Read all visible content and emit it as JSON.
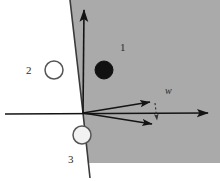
{
  "figure": {
    "type": "geometric-half-plane-diagram",
    "canvas": {
      "width": 220,
      "height": 181
    },
    "background_color": "#ffffff",
    "shaded_region_color": "#a8a8a8",
    "stroke_color": "#1a1a1a",
    "label_color": "#2b2b2b"
  },
  "labels": {
    "region_1": "1",
    "class_2": "2",
    "class_3": "3",
    "vector_w": "w"
  },
  "axes": {
    "horizontal": {
      "name": "horizontal-axis",
      "from": [
        5,
        113
      ],
      "to": [
        215,
        113
      ],
      "arrowhead": "right"
    },
    "vertical": {
      "name": "vertical-axis",
      "from": [
        83,
        113
      ],
      "to": [
        84,
        5
      ],
      "arrowhead": "up"
    },
    "origin": [
      83,
      113
    ]
  },
  "boundary_line": {
    "name": "decision-boundary",
    "points": [
      [
        70,
        0
      ],
      [
        83,
        113
      ],
      [
        90,
        178
      ]
    ]
  },
  "shaded_region": {
    "name": "positive-half-plane",
    "polygon": [
      [
        70,
        0
      ],
      [
        220,
        0
      ],
      [
        220,
        163
      ],
      [
        88,
        163
      ],
      [
        83,
        113
      ]
    ],
    "fill": "#a8a8a8"
  },
  "vectors": [
    {
      "name": "vector-upper",
      "from": [
        83,
        113
      ],
      "to": [
        156,
        101
      ],
      "arrowhead": true
    },
    {
      "name": "vector-lower",
      "from": [
        83,
        113
      ],
      "to": [
        158,
        126
      ],
      "arrowhead": true
    }
  ],
  "dashed_connector": {
    "name": "dashed-connector",
    "from": [
      155,
      101
    ],
    "to": [
      157,
      126
    ]
  },
  "markers": [
    {
      "name": "filled-point-class-1",
      "style": "filled",
      "center": [
        104,
        70
      ],
      "radius": 9,
      "fill": "#111111",
      "stroke": "#111111"
    },
    {
      "name": "open-point-class-2",
      "style": "open",
      "center": [
        54,
        70
      ],
      "radius": 9,
      "fill": "#ffffff",
      "stroke": "#555555"
    },
    {
      "name": "open-point-class-3",
      "style": "open",
      "center": [
        82,
        135
      ],
      "radius": 9,
      "fill": "#f2f2f2",
      "stroke": "#555555"
    }
  ]
}
